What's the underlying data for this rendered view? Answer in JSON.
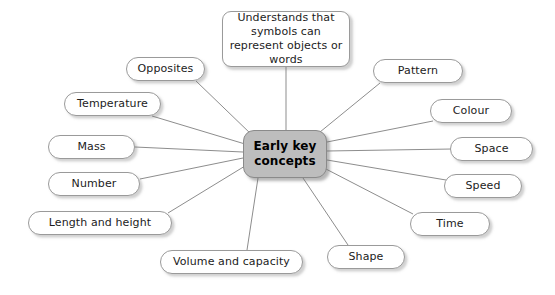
{
  "diagram": {
    "type": "mind-map",
    "title": "Early key concepts",
    "background_color": "#ffffff",
    "center_fill_color": "#bdbdbd",
    "node_border_color": "#9a9a9a",
    "edge_color": "#8d8d8d",
    "center": {
      "label": "Early key\nconcepts",
      "line1": "Early key",
      "line2": "concepts",
      "x": 243,
      "y": 130,
      "width": 84,
      "height": 48
    },
    "nodes": [
      {
        "id": "understands",
        "label": "Understands that symbols can represent objects or words",
        "line1": "Understands that",
        "line2": "symbols can represent",
        "line3": "objects or words",
        "multiline": true,
        "x": 222,
        "y": 11,
        "width": 128,
        "height": 56,
        "anchor_x": 286,
        "anchor_y": 67
      },
      {
        "id": "opposites",
        "label": "Opposites",
        "x": 126,
        "y": 57,
        "width": 79,
        "height": 24,
        "anchor_x": 196,
        "anchor_y": 81
      },
      {
        "id": "temperature",
        "label": "Temperature",
        "x": 64,
        "y": 92,
        "width": 97,
        "height": 24,
        "anchor_x": 152,
        "anchor_y": 116
      },
      {
        "id": "mass",
        "label": "Mass",
        "x": 48,
        "y": 135,
        "width": 87,
        "height": 24,
        "anchor_x": 135,
        "anchor_y": 147
      },
      {
        "id": "number",
        "label": "Number",
        "x": 48,
        "y": 172,
        "width": 92,
        "height": 24,
        "anchor_x": 140,
        "anchor_y": 179
      },
      {
        "id": "length-and-height",
        "label": "Length and height",
        "x": 28,
        "y": 211,
        "width": 144,
        "height": 24,
        "anchor_x": 168,
        "anchor_y": 213
      },
      {
        "id": "volume-and-capacity",
        "label": "Volume and capacity",
        "x": 160,
        "y": 250,
        "width": 143,
        "height": 24,
        "anchor_x": 247,
        "anchor_y": 250
      },
      {
        "id": "shape",
        "label": "Shape",
        "x": 327,
        "y": 245,
        "width": 78,
        "height": 24,
        "anchor_x": 348,
        "anchor_y": 245
      },
      {
        "id": "time",
        "label": "Time",
        "x": 410,
        "y": 212,
        "width": 80,
        "height": 24,
        "anchor_x": 413,
        "anchor_y": 214
      },
      {
        "id": "speed",
        "label": "Speed",
        "x": 444,
        "y": 174,
        "width": 78,
        "height": 24,
        "anchor_x": 446,
        "anchor_y": 180
      },
      {
        "id": "space",
        "label": "Space",
        "x": 450,
        "y": 137,
        "width": 83,
        "height": 24,
        "anchor_x": 452,
        "anchor_y": 149
      },
      {
        "id": "colour",
        "label": "Colour",
        "x": 430,
        "y": 99,
        "width": 82,
        "height": 24,
        "anchor_x": 433,
        "anchor_y": 121
      },
      {
        "id": "pattern",
        "label": "Pattern",
        "x": 373,
        "y": 59,
        "width": 90,
        "height": 24,
        "anchor_x": 380,
        "anchor_y": 83
      }
    ],
    "edges": [
      {
        "from": "center",
        "to": "understands",
        "x1": 286,
        "y1": 130,
        "x2": 286,
        "y2": 67
      },
      {
        "from": "center",
        "to": "opposites",
        "x1": 252,
        "y1": 135,
        "x2": 196,
        "y2": 81
      },
      {
        "from": "center",
        "to": "temperature",
        "x1": 245,
        "y1": 144,
        "x2": 152,
        "y2": 116
      },
      {
        "from": "center",
        "to": "mass",
        "x1": 243,
        "y1": 152,
        "x2": 135,
        "y2": 147
      },
      {
        "from": "center",
        "to": "number",
        "x1": 243,
        "y1": 158,
        "x2": 140,
        "y2": 179
      },
      {
        "from": "center",
        "to": "length-and-height",
        "x1": 245,
        "y1": 166,
        "x2": 168,
        "y2": 213
      },
      {
        "from": "center",
        "to": "volume-and-capacity",
        "x1": 258,
        "y1": 178,
        "x2": 247,
        "y2": 250
      },
      {
        "from": "center",
        "to": "shape",
        "x1": 303,
        "y1": 178,
        "x2": 348,
        "y2": 245
      },
      {
        "from": "center",
        "to": "time",
        "x1": 324,
        "y1": 168,
        "x2": 413,
        "y2": 214
      },
      {
        "from": "center",
        "to": "speed",
        "x1": 327,
        "y1": 160,
        "x2": 446,
        "y2": 180
      },
      {
        "from": "center",
        "to": "space",
        "x1": 327,
        "y1": 151,
        "x2": 452,
        "y2": 149
      },
      {
        "from": "center",
        "to": "colour",
        "x1": 327,
        "y1": 142,
        "x2": 433,
        "y2": 121
      },
      {
        "from": "center",
        "to": "pattern",
        "x1": 320,
        "y1": 132,
        "x2": 380,
        "y2": 83
      }
    ]
  }
}
